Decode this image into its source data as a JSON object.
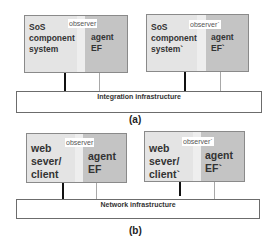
{
  "panels": {
    "a": {
      "caption": "(a)",
      "infrastructure_label": "Integration infrastructure",
      "left": {
        "system_label": "SoS\ncomponent\nsystem",
        "observer_label": "observer",
        "agent_label": "agent\nEF"
      },
      "right": {
        "system_label": "SoS\ncomponent\nsystem`",
        "observer_label": "observer`",
        "agent_label": "agent\nEF`"
      }
    },
    "b": {
      "caption": "(b)",
      "infrastructure_label": "Network infrastructure",
      "left": {
        "system_label": "web\nsever/\nclient",
        "observer_label": "observer",
        "agent_label": "agent\nEF"
      },
      "right": {
        "system_label": "web\nsever/\nclient`",
        "observer_label": "observer`",
        "agent_label": "agent\nEF`"
      }
    }
  },
  "colors": {
    "system_fill": "#e4e4e4",
    "observer_fill": "#eeeeee",
    "agent_fill": "#c4c4c4",
    "dark_link": "#111111",
    "light_link": "#a8a8a8"
  }
}
